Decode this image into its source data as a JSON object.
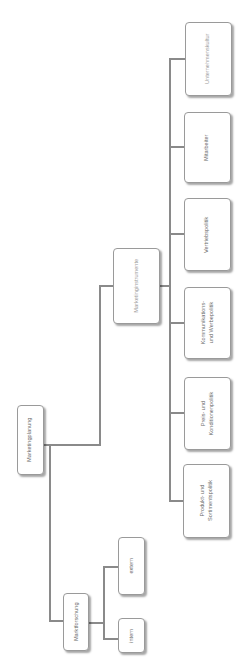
{
  "root": {
    "label": "Marketingplanung"
  },
  "branches": [
    {
      "label": "Marketinginstrumente",
      "children": [
        {
          "line1": "Produkt- und",
          "line2": "Sortimentspolitik"
        },
        {
          "line1": "Preis- und",
          "line2": "Konditionenpolitik"
        },
        {
          "line1": "Kommunikations-",
          "line2": "und Werbepolitik"
        },
        {
          "line1": "Vertriebspolitik",
          "line2": ""
        },
        {
          "line1": "Mitarbeiter",
          "line2": ""
        },
        {
          "line1": "Unternehmenskultur",
          "line2": ""
        }
      ]
    },
    {
      "label": "Marktforschung",
      "children": [
        {
          "label": "intern"
        },
        {
          "label": "extern"
        }
      ]
    }
  ],
  "colors": {
    "line": "#8a8a8a",
    "border": "#9a9a9a",
    "text": "#6a6a6a"
  }
}
